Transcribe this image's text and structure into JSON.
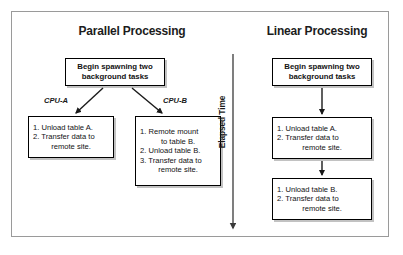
{
  "figure": {
    "border_color": "#9a9a9a",
    "background": "#ffffff",
    "box_border_color": "#000000",
    "text_color": "#121212"
  },
  "columns": {
    "parallel": {
      "heading": "Parallel Processing",
      "start_box": {
        "line1": "Begin spawning two",
        "line2": "background tasks"
      },
      "branches": [
        {
          "label": "CPU-A",
          "steps": [
            {
              "line": "1. Unload table A."
            },
            {
              "line": "2. Transfer data to"
            },
            {
              "cont": "remote site."
            }
          ]
        },
        {
          "label": "CPU-B",
          "steps": [
            {
              "line": "1. Remote mount"
            },
            {
              "cont": "to table B."
            },
            {
              "line": "2. Unload table B."
            },
            {
              "line": "3. Transfer data to"
            },
            {
              "cont": "remote site."
            }
          ]
        }
      ]
    },
    "linear": {
      "heading": "Linear Processing",
      "start_box": {
        "line1": "Begin spawning two",
        "line2": "background tasks"
      },
      "steps_boxes": [
        {
          "steps": [
            {
              "line": "1. Unload table A."
            },
            {
              "line": "2. Transfer data to"
            },
            {
              "cont": "remote site."
            }
          ]
        },
        {
          "steps": [
            {
              "line": "1. Unload table B."
            },
            {
              "line": "2. Transfer data to"
            },
            {
              "cont": "remote site."
            }
          ]
        }
      ]
    }
  },
  "axis": {
    "label": "Elapsed Time",
    "direction": "downward-arrow"
  }
}
